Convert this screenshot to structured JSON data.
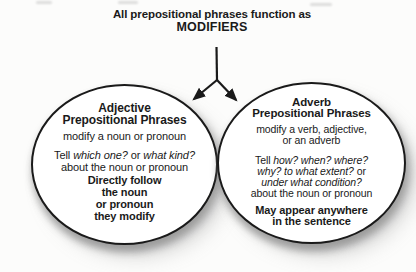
{
  "title": {
    "line1": "All prepositional phrases function as",
    "line2": "MODIFIERS"
  },
  "adjective_circle": {
    "heading1": "Adjective",
    "heading2": "Prepositional Phrases",
    "function": "modify a noun or pronoun",
    "questions": {
      "prefix": "Tell ",
      "q1": "which one?",
      "conjunction": " or ",
      "q2": "what kind?"
    },
    "about": "about the noun or pronoun",
    "placement": [
      "Directly follow",
      "the noun",
      "or pronoun",
      "they modify"
    ]
  },
  "adverb_circle": {
    "heading1": "Adverb",
    "heading2": "Prepositional Phrases",
    "function1": "modify a verb, adjective,",
    "function2": "or an adverb",
    "questions": {
      "prefix": "Tell ",
      "row1": "how? when? where?",
      "row2_italic": "why? to what extent?",
      "row2_tail": " or",
      "row3": "under what condition?"
    },
    "about": "about the noun or pronoun",
    "placement": [
      "May appear anywhere",
      "in the sentence"
    ]
  },
  "colors": {
    "ink": "#1a1a1a",
    "circle_outline": "#1a1a1a",
    "circle_fill": "#ffffff",
    "shadow": "#a8a8a8",
    "background": "#fcfcfb"
  }
}
